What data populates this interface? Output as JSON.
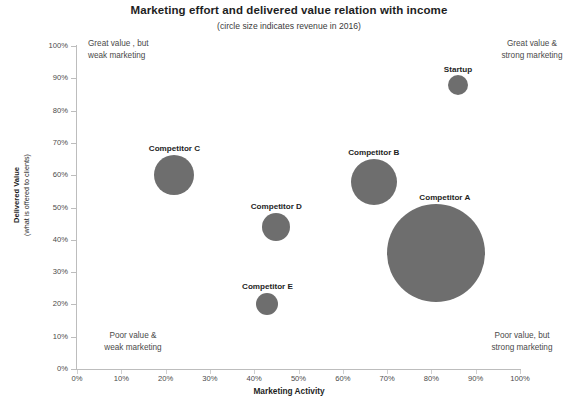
{
  "chart_data": {
    "type": "scatter",
    "title": "Marketing effort and delivered value relation with income",
    "subtitle": "(circle size indicates revenue in 2016)",
    "xlabel": "Marketing Activity",
    "ylabel_line1": "Delivered Value",
    "ylabel_line2": "(what is offered  to clients)",
    "xlim": [
      0,
      100
    ],
    "ylim": [
      0,
      100
    ],
    "x_ticks": [
      "0%",
      "10%",
      "20%",
      "30%",
      "40%",
      "50%",
      "60%",
      "70%",
      "80%",
      "90%",
      "100%"
    ],
    "y_ticks": [
      "0%",
      "10%",
      "20%",
      "30%",
      "40%",
      "50%",
      "60%",
      "70%",
      "80%",
      "90%",
      "100%"
    ],
    "x_tick_values": [
      0,
      10,
      20,
      30,
      40,
      50,
      60,
      70,
      80,
      90,
      100
    ],
    "y_tick_values": [
      0,
      10,
      20,
      30,
      40,
      50,
      60,
      70,
      80,
      90,
      100
    ],
    "grid": false,
    "legend": "none",
    "bubble_color": "#6e6e6e",
    "size_encodes": "revenue in 2016",
    "points": [
      {
        "label": "Startup",
        "x": 86,
        "y": 88,
        "r_px": 10,
        "label_dx": 0,
        "label_dy": -20
      },
      {
        "label": "Competitor C",
        "x": 22,
        "y": 60,
        "r_px": 20,
        "label_dx": 0,
        "label_dy": -31
      },
      {
        "label": "Competitor B",
        "x": 67,
        "y": 58,
        "r_px": 23,
        "label_dx": 0,
        "label_dy": -34
      },
      {
        "label": "Competitor A",
        "x": 81,
        "y": 36,
        "r_px": 49,
        "label_dx": 9,
        "label_dy": -60
      },
      {
        "label": "Competitor D",
        "x": 45,
        "y": 44,
        "r_px": 14,
        "label_dx": 0,
        "label_dy": -25
      },
      {
        "label": "Competitor E",
        "x": 43,
        "y": 20,
        "r_px": 11,
        "label_dx": 0,
        "label_dy": -22
      }
    ],
    "annotations": [
      {
        "id": "top-left",
        "text": "Great value , but\n weak marketing"
      },
      {
        "id": "top-right",
        "text": "Great value &\nstrong marketing"
      },
      {
        "id": "bottom-left",
        "text": "Poor value &\nweak  marketing"
      },
      {
        "id": "bottom-right",
        "text": "Poor  value, but\nstrong marketing"
      }
    ]
  }
}
